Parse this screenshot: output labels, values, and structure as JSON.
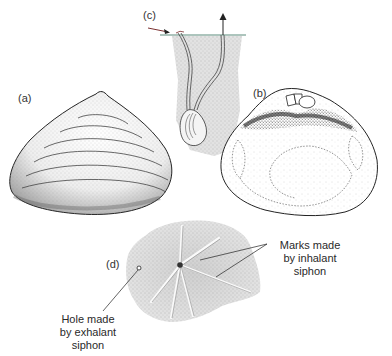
{
  "figure": {
    "panels": [
      {
        "id": "a",
        "label": "(a)",
        "description": "External view of shell valve with concentric growth lines"
      },
      {
        "id": "b",
        "label": "(b)",
        "description": "Internal view of shell valve showing hinge and muscle scars"
      },
      {
        "id": "c",
        "label": "(c)",
        "description": "Clam buried in sediment with inhalant and exhalant siphons reaching surface"
      },
      {
        "id": "d",
        "label": "(d)",
        "description": "Star-shaped feeding traces on sediment surface"
      }
    ],
    "annotations": {
      "inhalant": {
        "lines": [
          "Marks made",
          "by inhalant",
          "siphon"
        ]
      },
      "exhalant": {
        "lines": [
          "Hole made",
          "by exhalant",
          "siphon"
        ]
      }
    },
    "colors": {
      "ink": "#222222",
      "stipple": "#777777",
      "sediment": "#d9d9d9",
      "water_line": "#5a8a7a",
      "arrow_in": "#7a3030"
    }
  }
}
